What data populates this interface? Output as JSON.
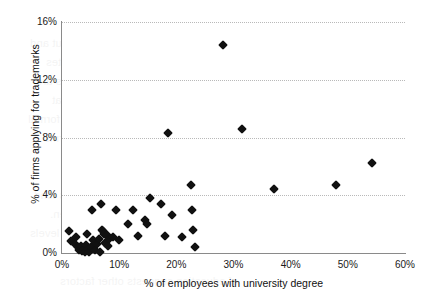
{
  "chart_data": {
    "type": "scatter",
    "title": "",
    "xlabel": "% of employees with university degree",
    "ylabel": "% of firms applying for trademarks",
    "xlim": [
      0,
      60
    ],
    "ylim": [
      0,
      16
    ],
    "xticks": [
      "0%",
      "10%",
      "20%",
      "30%",
      "40%",
      "50%",
      "60%"
    ],
    "xtick_values": [
      0,
      10,
      20,
      30,
      40,
      50,
      60
    ],
    "yticks": [
      "0%",
      "4%",
      "8%",
      "12%",
      "16%"
    ],
    "ytick_values": [
      0,
      4,
      8,
      12,
      16
    ],
    "grid": "horizontal-dotted",
    "legend": null,
    "marker": "filled-diamond",
    "marker_color": "#111111",
    "n_points": 52,
    "points": [
      {
        "x": 1.2,
        "y": 1.5
      },
      {
        "x": 1.5,
        "y": 0.8
      },
      {
        "x": 2.2,
        "y": 0.6
      },
      {
        "x": 2.4,
        "y": 1.1
      },
      {
        "x": 2.8,
        "y": 0.4
      },
      {
        "x": 3.0,
        "y": 0.2
      },
      {
        "x": 3.3,
        "y": 0.5
      },
      {
        "x": 3.5,
        "y": 0.15
      },
      {
        "x": 3.8,
        "y": 0.3
      },
      {
        "x": 4.0,
        "y": 0.1
      },
      {
        "x": 4.2,
        "y": 0.55
      },
      {
        "x": 4.3,
        "y": 1.3
      },
      {
        "x": 4.5,
        "y": 0.25
      },
      {
        "x": 4.8,
        "y": 0.05
      },
      {
        "x": 5.0,
        "y": 0.45
      },
      {
        "x": 5.2,
        "y": 3.0
      },
      {
        "x": 5.5,
        "y": 0.9
      },
      {
        "x": 5.8,
        "y": 0.2
      },
      {
        "x": 6.2,
        "y": 0.6
      },
      {
        "x": 6.5,
        "y": 1.0
      },
      {
        "x": 6.6,
        "y": 0.1
      },
      {
        "x": 6.9,
        "y": 3.4
      },
      {
        "x": 7.0,
        "y": 1.6
      },
      {
        "x": 7.2,
        "y": 1.5
      },
      {
        "x": 7.4,
        "y": 1.35
      },
      {
        "x": 7.6,
        "y": 0.7
      },
      {
        "x": 7.8,
        "y": 1.25
      },
      {
        "x": 8.0,
        "y": 0.5
      },
      {
        "x": 8.3,
        "y": 1.0
      },
      {
        "x": 9.0,
        "y": 1.1
      },
      {
        "x": 9.4,
        "y": 3.0
      },
      {
        "x": 10.0,
        "y": 0.9
      },
      {
        "x": 11.5,
        "y": 2.0
      },
      {
        "x": 12.5,
        "y": 3.0
      },
      {
        "x": 13.3,
        "y": 1.2
      },
      {
        "x": 14.5,
        "y": 2.3
      },
      {
        "x": 14.8,
        "y": 2.0
      },
      {
        "x": 15.4,
        "y": 3.8
      },
      {
        "x": 17.3,
        "y": 3.4
      },
      {
        "x": 18.0,
        "y": 1.2
      },
      {
        "x": 18.5,
        "y": 8.3
      },
      {
        "x": 19.3,
        "y": 2.6
      },
      {
        "x": 21.0,
        "y": 1.1
      },
      {
        "x": 22.6,
        "y": 4.7
      },
      {
        "x": 22.8,
        "y": 3.0
      },
      {
        "x": 23.0,
        "y": 1.6
      },
      {
        "x": 23.2,
        "y": 0.4
      },
      {
        "x": 28.2,
        "y": 14.4
      },
      {
        "x": 31.5,
        "y": 8.6
      },
      {
        "x": 37.0,
        "y": 4.4
      },
      {
        "x": 48.0,
        "y": 4.7
      },
      {
        "x": 54.2,
        "y": 6.2
      }
    ]
  },
  "background_bleed": {
    "lines": [
      "the measure of innovation output and",
      "analysis of the sample of firms indicates",
      "a positive relationship. The results are",
      "consistent with prior studies that",
      "examine human capital and formal",
      "intellectual property protection. Firms",
      "with a larger share of graduates tend",
      "to register trademarks more often.",
      "However, the dispersion at low levels",
      "of education suggests other factors"
    ]
  }
}
